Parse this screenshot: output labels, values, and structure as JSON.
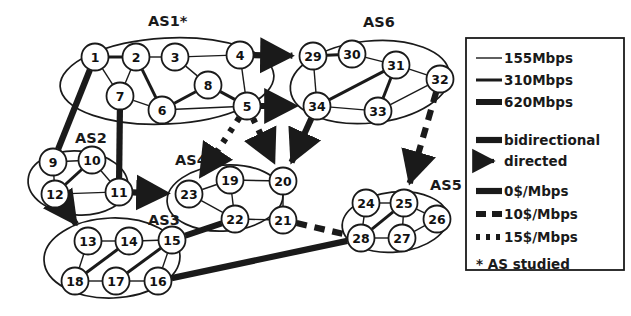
{
  "figure": {
    "as_studied_marker": "*"
  },
  "domains": [
    {
      "id": "as1",
      "label": "AS1*",
      "label_x": 148,
      "label_y": 26,
      "cloud": {
        "cx": 167,
        "cy": 81,
        "rx": 107,
        "ry": 43,
        "rot": -3
      }
    },
    {
      "id": "as2",
      "label": "AS2",
      "label_x": 75,
      "label_y": 143,
      "cloud": {
        "cx": 78,
        "cy": 183,
        "rx": 50,
        "ry": 32,
        "rot": 4
      }
    },
    {
      "id": "as3",
      "label": "AS3",
      "label_x": 148,
      "label_y": 225,
      "cloud": {
        "cx": 112,
        "cy": 258,
        "rx": 68,
        "ry": 40,
        "rot": -2
      }
    },
    {
      "id": "as4",
      "label": "AS4",
      "label_x": 175,
      "label_y": 165,
      "cloud": {
        "cx": 225,
        "cy": 198,
        "rx": 58,
        "ry": 33,
        "rot": -4
      }
    },
    {
      "id": "as5",
      "label": "AS5",
      "label_x": 430,
      "label_y": 190,
      "cloud": {
        "cx": 395,
        "cy": 222,
        "rx": 53,
        "ry": 30,
        "rot": -6
      }
    },
    {
      "id": "as6",
      "label": "AS6",
      "label_x": 363,
      "label_y": 27,
      "cloud": {
        "cx": 370,
        "cy": 82,
        "rx": 80,
        "ry": 41,
        "rot": -6
      }
    }
  ],
  "nodes": [
    {
      "id": 1,
      "label": "1",
      "x": 95,
      "y": 57,
      "as": "as1"
    },
    {
      "id": 2,
      "label": "2",
      "x": 136,
      "y": 57,
      "as": "as1"
    },
    {
      "id": 3,
      "label": "3",
      "x": 175,
      "y": 57,
      "as": "as1"
    },
    {
      "id": 4,
      "label": "4",
      "x": 240,
      "y": 55,
      "as": "as1"
    },
    {
      "id": 5,
      "label": "5",
      "x": 247,
      "y": 106,
      "as": "as1"
    },
    {
      "id": 6,
      "label": "6",
      "x": 162,
      "y": 110,
      "as": "as1"
    },
    {
      "id": 7,
      "label": "7",
      "x": 120,
      "y": 96,
      "as": "as1"
    },
    {
      "id": 8,
      "label": "8",
      "x": 208,
      "y": 85,
      "as": "as1"
    },
    {
      "id": 9,
      "label": "9",
      "x": 53,
      "y": 162,
      "as": "as2"
    },
    {
      "id": 10,
      "label": "10",
      "x": 92,
      "y": 160,
      "as": "as2"
    },
    {
      "id": 11,
      "label": "11",
      "x": 119,
      "y": 192,
      "as": "as2"
    },
    {
      "id": 12,
      "label": "12",
      "x": 55,
      "y": 194,
      "as": "as2"
    },
    {
      "id": 13,
      "label": "13",
      "x": 88,
      "y": 241,
      "as": "as3"
    },
    {
      "id": 14,
      "label": "14",
      "x": 129,
      "y": 241,
      "as": "as3"
    },
    {
      "id": 15,
      "label": "15",
      "x": 172,
      "y": 240,
      "as": "as3"
    },
    {
      "id": 16,
      "label": "16",
      "x": 158,
      "y": 281,
      "as": "as3"
    },
    {
      "id": 17,
      "label": "17",
      "x": 116,
      "y": 281,
      "as": "as3"
    },
    {
      "id": 18,
      "label": "18",
      "x": 75,
      "y": 281,
      "as": "as3"
    },
    {
      "id": 19,
      "label": "19",
      "x": 230,
      "y": 180,
      "as": "as4"
    },
    {
      "id": 20,
      "label": "20",
      "x": 283,
      "y": 181,
      "as": "as4"
    },
    {
      "id": 21,
      "label": "21",
      "x": 283,
      "y": 220,
      "as": "as4"
    },
    {
      "id": 22,
      "label": "22",
      "x": 235,
      "y": 219,
      "as": "as4"
    },
    {
      "id": 23,
      "label": "23",
      "x": 189,
      "y": 194,
      "as": "as4"
    },
    {
      "id": 24,
      "label": "24",
      "x": 366,
      "y": 203,
      "as": "as5"
    },
    {
      "id": 25,
      "label": "25",
      "x": 404,
      "y": 203,
      "as": "as5"
    },
    {
      "id": 26,
      "label": "26",
      "x": 437,
      "y": 219,
      "as": "as5"
    },
    {
      "id": 27,
      "label": "27",
      "x": 402,
      "y": 238,
      "as": "as5"
    },
    {
      "id": 28,
      "label": "28",
      "x": 361,
      "y": 238,
      "as": "as5"
    },
    {
      "id": 29,
      "label": "29",
      "x": 313,
      "y": 56,
      "as": "as6"
    },
    {
      "id": 30,
      "label": "30",
      "x": 352,
      "y": 54,
      "as": "as6"
    },
    {
      "id": 31,
      "label": "31",
      "x": 396,
      "y": 65,
      "as": "as6"
    },
    {
      "id": 32,
      "label": "32",
      "x": 440,
      "y": 79,
      "as": "as6"
    },
    {
      "id": 33,
      "label": "33",
      "x": 378,
      "y": 111,
      "as": "as6"
    },
    {
      "id": 34,
      "label": "34",
      "x": 317,
      "y": 106,
      "as": "as6"
    }
  ],
  "links": [
    {
      "from": 1,
      "to": 2,
      "capacity": "310Mbps",
      "price": "0$/Mbps",
      "directed": false
    },
    {
      "from": 1,
      "to": 7,
      "capacity": "155Mbps",
      "price": "0$/Mbps",
      "directed": false
    },
    {
      "from": 2,
      "to": 3,
      "capacity": "155Mbps",
      "price": "0$/Mbps",
      "directed": false
    },
    {
      "from": 2,
      "to": 7,
      "capacity": "155Mbps",
      "price": "0$/Mbps",
      "directed": false
    },
    {
      "from": 2,
      "to": 6,
      "capacity": "310Mbps",
      "price": "0$/Mbps",
      "directed": false
    },
    {
      "from": 3,
      "to": 4,
      "capacity": "155Mbps",
      "price": "0$/Mbps",
      "directed": false
    },
    {
      "from": 3,
      "to": 8,
      "capacity": "155Mbps",
      "price": "0$/Mbps",
      "directed": false
    },
    {
      "from": 4,
      "to": 5,
      "capacity": "155Mbps",
      "price": "0$/Mbps",
      "directed": false
    },
    {
      "from": 5,
      "to": 8,
      "capacity": "310Mbps",
      "price": "0$/Mbps",
      "directed": false
    },
    {
      "from": 6,
      "to": 8,
      "capacity": "310Mbps",
      "price": "0$/Mbps",
      "directed": false
    },
    {
      "from": 6,
      "to": 7,
      "capacity": "155Mbps",
      "price": "0$/Mbps",
      "directed": false
    },
    {
      "from": 6,
      "to": 5,
      "capacity": "155Mbps",
      "price": "0$/Mbps",
      "directed": false
    },
    {
      "from": 1,
      "to": 9,
      "capacity": "620Mbps",
      "price": "0$/Mbps",
      "directed": false
    },
    {
      "from": 7,
      "to": 11,
      "capacity": "620Mbps",
      "price": "0$/Mbps",
      "directed": false
    },
    {
      "from": 9,
      "to": 10,
      "capacity": "155Mbps",
      "price": "0$/Mbps",
      "directed": false
    },
    {
      "from": 9,
      "to": 12,
      "capacity": "155Mbps",
      "price": "0$/Mbps",
      "directed": false
    },
    {
      "from": 10,
      "to": 12,
      "capacity": "310Mbps",
      "price": "0$/Mbps",
      "directed": false
    },
    {
      "from": 10,
      "to": 11,
      "capacity": "155Mbps",
      "price": "0$/Mbps",
      "directed": false
    },
    {
      "from": 12,
      "to": 11,
      "capacity": "155Mbps",
      "price": "0$/Mbps",
      "directed": false
    },
    {
      "from": 12,
      "to": 13,
      "capacity": "620Mbps",
      "price": "10$/Mbps",
      "directed": true
    },
    {
      "from": 11,
      "to": 23,
      "capacity": "620Mbps",
      "price": "15$/Mbps",
      "directed": true
    },
    {
      "from": 13,
      "to": 14,
      "capacity": "155Mbps",
      "price": "0$/Mbps",
      "directed": false
    },
    {
      "from": 13,
      "to": 18,
      "capacity": "155Mbps",
      "price": "0$/Mbps",
      "directed": false
    },
    {
      "from": 14,
      "to": 15,
      "capacity": "155Mbps",
      "price": "0$/Mbps",
      "directed": false
    },
    {
      "from": 14,
      "to": 18,
      "capacity": "310Mbps",
      "price": "0$/Mbps",
      "directed": false
    },
    {
      "from": 15,
      "to": 16,
      "capacity": "155Mbps",
      "price": "0$/Mbps",
      "directed": false
    },
    {
      "from": 15,
      "to": 17,
      "capacity": "310Mbps",
      "price": "0$/Mbps",
      "directed": false
    },
    {
      "from": 17,
      "to": 18,
      "capacity": "155Mbps",
      "price": "0$/Mbps",
      "directed": false
    },
    {
      "from": 17,
      "to": 16,
      "capacity": "155Mbps",
      "price": "0$/Mbps",
      "directed": false
    },
    {
      "from": 15,
      "to": 22,
      "capacity": "620Mbps",
      "price": "0$/Mbps",
      "directed": false
    },
    {
      "from": 16,
      "to": 28,
      "capacity": "620Mbps",
      "price": "0$/Mbps",
      "directed": false
    },
    {
      "from": 19,
      "to": 20,
      "capacity": "155Mbps",
      "price": "0$/Mbps",
      "directed": false
    },
    {
      "from": 19,
      "to": 22,
      "capacity": "155Mbps",
      "price": "0$/Mbps",
      "directed": false
    },
    {
      "from": 19,
      "to": 23,
      "capacity": "155Mbps",
      "price": "0$/Mbps",
      "directed": false
    },
    {
      "from": 20,
      "to": 21,
      "capacity": "155Mbps",
      "price": "0$/Mbps",
      "directed": false
    },
    {
      "from": 21,
      "to": 22,
      "capacity": "155Mbps",
      "price": "0$/Mbps",
      "directed": false
    },
    {
      "from": 22,
      "to": 23,
      "capacity": "155Mbps",
      "price": "0$/Mbps",
      "directed": false
    },
    {
      "from": 21,
      "to": 28,
      "capacity": "620Mbps",
      "price": "10$/Mbps",
      "directed": false
    },
    {
      "from": 24,
      "to": 25,
      "capacity": "155Mbps",
      "price": "0$/Mbps",
      "directed": false
    },
    {
      "from": 24,
      "to": 28,
      "capacity": "155Mbps",
      "price": "0$/Mbps",
      "directed": false
    },
    {
      "from": 25,
      "to": 27,
      "capacity": "155Mbps",
      "price": "0$/Mbps",
      "directed": false
    },
    {
      "from": 25,
      "to": 26,
      "capacity": "155Mbps",
      "price": "0$/Mbps",
      "directed": false
    },
    {
      "from": 26,
      "to": 27,
      "capacity": "155Mbps",
      "price": "0$/Mbps",
      "directed": false
    },
    {
      "from": 27,
      "to": 28,
      "capacity": "155Mbps",
      "price": "0$/Mbps",
      "directed": false
    },
    {
      "from": 25,
      "to": 28,
      "capacity": "310Mbps",
      "price": "0$/Mbps",
      "directed": false
    },
    {
      "from": 29,
      "to": 30,
      "capacity": "310Mbps",
      "price": "0$/Mbps",
      "directed": false
    },
    {
      "from": 29,
      "to": 34,
      "capacity": "155Mbps",
      "price": "0$/Mbps",
      "directed": false
    },
    {
      "from": 30,
      "to": 31,
      "capacity": "155Mbps",
      "price": "0$/Mbps",
      "directed": false
    },
    {
      "from": 31,
      "to": 32,
      "capacity": "155Mbps",
      "price": "0$/Mbps",
      "directed": false
    },
    {
      "from": 31,
      "to": 33,
      "capacity": "310Mbps",
      "price": "0$/Mbps",
      "directed": false
    },
    {
      "from": 31,
      "to": 34,
      "capacity": "310Mbps",
      "price": "0$/Mbps",
      "directed": false
    },
    {
      "from": 32,
      "to": 33,
      "capacity": "155Mbps",
      "price": "0$/Mbps",
      "directed": false
    },
    {
      "from": 33,
      "to": 34,
      "capacity": "155Mbps",
      "price": "0$/Mbps",
      "directed": false
    },
    {
      "from": 4,
      "to": 29,
      "capacity": "620Mbps",
      "price": "10$/Mbps",
      "directed": true
    },
    {
      "from": 5,
      "to": 34,
      "capacity": "620Mbps",
      "price": "10$/Mbps",
      "directed": true
    },
    {
      "from": 5,
      "to": 23,
      "capacity": "620Mbps",
      "price": "15$/Mbps",
      "directed": true
    },
    {
      "from": 5,
      "to": 20,
      "capacity": "620Mbps",
      "price": "15$/Mbps",
      "directed": true
    },
    {
      "from": 34,
      "to": 20,
      "capacity": "620Mbps",
      "price": "0$/Mbps",
      "directed": true
    },
    {
      "from": 32,
      "to": 25,
      "capacity": "620Mbps",
      "price": "10$/Mbps",
      "directed": true
    }
  ],
  "legend": {
    "capacity_group": [
      {
        "key": "155Mbps",
        "label": "155Mbps",
        "width": 1.4
      },
      {
        "key": "310Mbps",
        "label": "310Mbps",
        "width": 3.0
      },
      {
        "key": "620Mbps",
        "label": "620Mbps",
        "width": 6.0
      }
    ],
    "direction_group": [
      {
        "key": "bidirectional",
        "label": "bidirectional"
      },
      {
        "key": "directed",
        "label": "directed"
      }
    ],
    "price_group": [
      {
        "key": "0$/Mbps",
        "label": "0$/Mbps",
        "dash": "none"
      },
      {
        "key": "10$/Mbps",
        "label": "10$/Mbps",
        "dash": "10,6"
      },
      {
        "key": "15$/Mbps",
        "label": "15$/Mbps",
        "dash": "4,6"
      }
    ],
    "footnote": "* AS studied"
  },
  "colors": {
    "ink": "#1a1a1a",
    "paper": "#ffffff"
  }
}
